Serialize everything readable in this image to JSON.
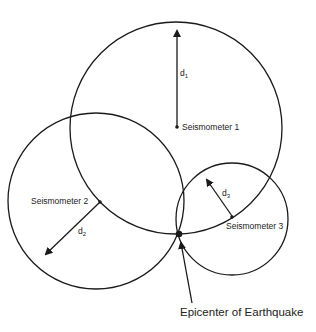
{
  "diagram": {
    "stations": [
      {
        "label": "Seismometer 1",
        "distance_label": "d",
        "distance_sub": "1"
      },
      {
        "label": "Seismometer 2",
        "distance_label": "d",
        "distance_sub": "2"
      },
      {
        "label": "Seismometer 3",
        "distance_label": "d",
        "distance_sub": "3"
      }
    ],
    "epicenter_label": "Epicenter of Earthquake",
    "colors": {
      "stroke": "#1a1a1a",
      "background": "#ffffff"
    }
  }
}
